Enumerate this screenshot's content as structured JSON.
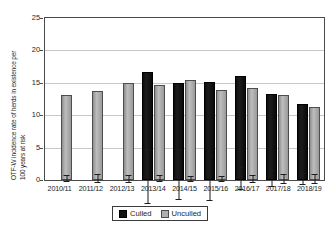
{
  "chart_data": {
    "type": "bar",
    "title": "",
    "xlabel": "",
    "ylabel": "OTF-W incidence rate of herds in existence per 100 years at risk",
    "ylabel_line1": "OTF-W incidence rate of herds in existence per",
    "ylabel_line2": "100 years at risk",
    "ylim": [
      0,
      25
    ],
    "yticks": [
      0,
      5,
      10,
      15,
      20,
      25
    ],
    "ytick_labels": [
      "0",
      "5",
      "10",
      "15",
      "20",
      "25"
    ],
    "grid": true,
    "legend_position": "bottom",
    "categories": [
      "2010/11",
      "2011/12",
      "2012/13",
      "2013/14",
      "2014/15",
      "2015/16",
      "2016/17",
      "2017/18",
      "2018/19"
    ],
    "series": [
      {
        "name": "Culled",
        "color": "#141414",
        "values": [
          null,
          null,
          null,
          16.7,
          14.9,
          15.2,
          16.1,
          13.3,
          11.8
        ],
        "err_low": [
          null,
          null,
          null,
          12.8,
          11.7,
          11.8,
          14.4,
          12.0,
          10.9
        ],
        "err_high": [
          null,
          null,
          null,
          21.4,
          19.6,
          18.9,
          17.9,
          14.7,
          12.8
        ]
      },
      {
        "name": "Unculled",
        "color": "#a8a8a8",
        "values": [
          13.1,
          13.8,
          14.9,
          14.6,
          15.5,
          13.9,
          14.2,
          13.1,
          11.3
        ],
        "err_low": [
          12.6,
          13.2,
          14.3,
          14.1,
          15.0,
          13.4,
          13.6,
          12.4,
          10.6
        ],
        "err_high": [
          13.7,
          14.5,
          15.5,
          15.2,
          16.0,
          14.4,
          14.8,
          13.9,
          12.0
        ]
      }
    ]
  },
  "legend": {
    "items": [
      {
        "label": "Culled",
        "swatch": "culled"
      },
      {
        "label": "Unculled",
        "swatch": "unculled"
      }
    ]
  }
}
